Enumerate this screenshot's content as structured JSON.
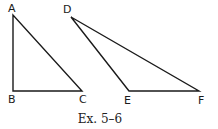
{
  "figure": {
    "caption": "Ex. 5–6",
    "stroke_color": "#1a1a1a",
    "triangles": [
      {
        "name": "ABC",
        "vertices": [
          {
            "label": "A",
            "x": 13,
            "y": 15
          },
          {
            "label": "B",
            "x": 13,
            "y": 91
          },
          {
            "label": "C",
            "x": 82,
            "y": 91
          }
        ]
      },
      {
        "name": "DEF",
        "vertices": [
          {
            "label": "D",
            "x": 71,
            "y": 17
          },
          {
            "label": "E",
            "x": 129,
            "y": 91
          },
          {
            "label": "F",
            "x": 199,
            "y": 91
          }
        ]
      }
    ],
    "labels": {
      "A": "A",
      "B": "B",
      "C": "C",
      "D": "D",
      "E": "E",
      "F": "F"
    }
  }
}
